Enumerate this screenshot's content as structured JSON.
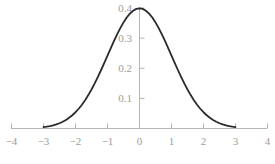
{
  "chart_data": {
    "type": "line",
    "title": "",
    "subtitle": "",
    "xlabel": "",
    "ylabel": "",
    "xlim": [
      -4,
      4
    ],
    "ylim": [
      0,
      0.42
    ],
    "grid": false,
    "legend": null,
    "legend_position": "none",
    "xticks": [
      -4,
      -3,
      -2,
      -1,
      0,
      1,
      2,
      3,
      4
    ],
    "xtick_labels": [
      "−4",
      "−3",
      "−2",
      "−1",
      "0",
      "1",
      "2",
      "3",
      "4"
    ],
    "yticks": [
      0.1,
      0.2,
      0.3,
      0.4
    ],
    "ytick_labels": [
      "0.1",
      "0.2",
      "0.3",
      "0.4"
    ],
    "series": [
      {
        "name": "standard normal pdf",
        "color": "#2b2b2b",
        "line_width": 1.8,
        "x": [
          -3,
          -2.9,
          -2.8,
          -2.7,
          -2.6,
          -2.5,
          -2.4,
          -2.3,
          -2.2,
          -2.1,
          -2,
          -1.9,
          -1.8,
          -1.7,
          -1.6,
          -1.5,
          -1.4,
          -1.3,
          -1.2,
          -1.1,
          -1,
          -0.9,
          -0.8,
          -0.7,
          -0.6,
          -0.5,
          -0.4,
          -0.3,
          -0.2,
          -0.1,
          0,
          0.1,
          0.2,
          0.3,
          0.4,
          0.5,
          0.6,
          0.7,
          0.8,
          0.9,
          1,
          1.1,
          1.2,
          1.3,
          1.4,
          1.5,
          1.6,
          1.7,
          1.8,
          1.9,
          2,
          2.1,
          2.2,
          2.3,
          2.4,
          2.5,
          2.6,
          2.7,
          2.8,
          2.9,
          3
        ],
        "y": [
          0.0044,
          0.006,
          0.0079,
          0.0104,
          0.0136,
          0.0175,
          0.0224,
          0.0283,
          0.0355,
          0.044,
          0.054,
          0.0656,
          0.079,
          0.094,
          0.1109,
          0.1295,
          0.1497,
          0.1714,
          0.1942,
          0.2179,
          0.242,
          0.2661,
          0.2897,
          0.3123,
          0.3332,
          0.3521,
          0.3683,
          0.3814,
          0.391,
          0.397,
          0.3989,
          0.397,
          0.391,
          0.3814,
          0.3683,
          0.3521,
          0.3332,
          0.3123,
          0.2897,
          0.2661,
          0.242,
          0.2179,
          0.1942,
          0.1714,
          0.1497,
          0.1295,
          0.1109,
          0.094,
          0.079,
          0.0656,
          0.054,
          0.044,
          0.0355,
          0.0283,
          0.0224,
          0.0175,
          0.0136,
          0.0104,
          0.0079,
          0.006,
          0.0044
        ]
      }
    ],
    "axes": {
      "x_axis_color": "#b4b4b4",
      "y_axis_color": "#b4b4b4",
      "tick_color": "#b4b4b4",
      "tick_label_color": "#9d9d9d"
    },
    "background_color": "#ffffff"
  }
}
